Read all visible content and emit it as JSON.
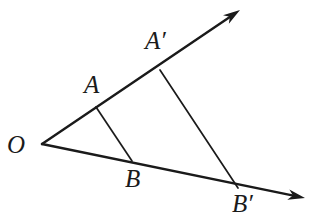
{
  "figure": {
    "type": "geometry-diagram",
    "background_color": "#ffffff",
    "stroke_color": "#1a1a1a",
    "canvas": {
      "width": 315,
      "height": 222
    },
    "vertex": {
      "name": "O",
      "label": "O",
      "x": 42,
      "y": 144
    },
    "rays": [
      {
        "name": "ray-OA-upper",
        "from": {
          "x": 42,
          "y": 144
        },
        "to": {
          "x": 240,
          "y": 10
        },
        "arrow": true,
        "stroke_width": 2.4
      },
      {
        "name": "ray-OB-lower",
        "from": {
          "x": 42,
          "y": 144
        },
        "to": {
          "x": 305,
          "y": 198
        },
        "arrow": true,
        "stroke_width": 2.4
      }
    ],
    "points": [
      {
        "name": "A",
        "label": "A",
        "x": 96,
        "y": 107,
        "on_ray": "ray-OA-upper"
      },
      {
        "name": "Ap",
        "label": "A′",
        "x": 160,
        "y": 70,
        "on_ray": "ray-OA-upper"
      },
      {
        "name": "B",
        "label": "B",
        "x": 132,
        "y": 161,
        "on_ray": "ray-OB-lower"
      },
      {
        "name": "Bp",
        "label": "B′",
        "x": 238,
        "y": 188,
        "on_ray": "ray-OB-lower"
      }
    ],
    "segments": [
      {
        "name": "segment-AB",
        "label": "AB",
        "from": {
          "x": 96,
          "y": 107
        },
        "to": {
          "x": 132,
          "y": 161
        },
        "stroke_width": 1.7
      },
      {
        "name": "segment-ApBp",
        "label": "A′B′",
        "from": {
          "x": 160,
          "y": 70
        },
        "to": {
          "x": 238,
          "y": 188
        },
        "stroke_width": 1.7
      }
    ],
    "labels": {
      "O": "O",
      "A": "A",
      "A_prime": "A′",
      "B": "B",
      "B_prime": "B′"
    }
  }
}
